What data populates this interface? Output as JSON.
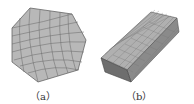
{
  "figure": {
    "panels": [
      {
        "label": "（a）",
        "description": "heptagonal cross-section quad mesh"
      },
      {
        "label": "（b）",
        "description": "extruded prism volume mesh"
      }
    ],
    "colors": {
      "mesh_fill": "#b8b8b8",
      "mesh_line": "#555555",
      "dark_face": "#6e6e6e"
    }
  }
}
